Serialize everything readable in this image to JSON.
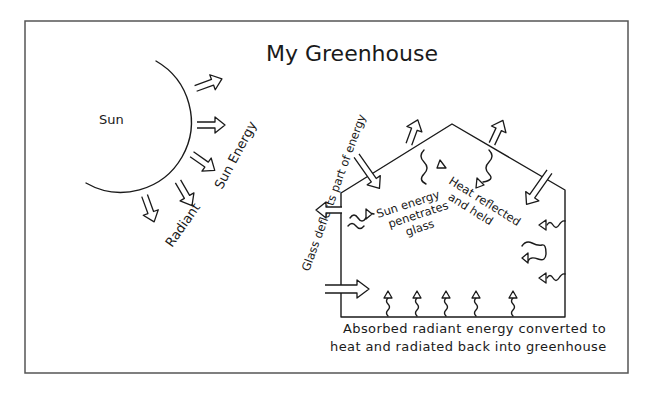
{
  "title": "My Greenhouse",
  "sun": {
    "label": "Sun",
    "radiant_label": "Radiant",
    "energy_label": "Sun Energy"
  },
  "greenhouse": {
    "glass_deflects": "Glass deflects part of energy",
    "sun_energy_line1": "Sun energy",
    "sun_energy_line2": "penetrates",
    "sun_energy_line3": "glass",
    "heat_line1": "Heat reflected",
    "heat_line2": "and held",
    "caption_line1": "Absorbed radiant energy converted to",
    "caption_line2": "heat and radiated back into greenhouse"
  },
  "colors": {
    "ink": "#1a1a1a",
    "frame": "#555555",
    "background": "#ffffff"
  }
}
